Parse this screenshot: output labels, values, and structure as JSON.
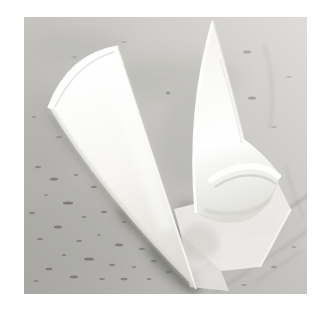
{
  "page": {
    "background": "#ffffff",
    "kind": "photograph-on-white-page"
  },
  "photo": {
    "type": "photograph",
    "alt": "Two white paper cones (rolled parchment piping cornets) on a gray marble surface: the left cone lies with its wide opening at the upper left and its tip pointing to the lower right; the right cone stands apex-up with its curled open end and a flat paper edge resting on the marble at the lower right. The marble is light gray with dark speckles at the lower left and diagonal veins at the lower right.",
    "objects": [
      {
        "name": "left-paper-cone",
        "description": "rolled white paper cone, wide opening upper-left, tapered tip lower-right"
      },
      {
        "name": "right-paper-cone",
        "description": "rolled white paper cone, apex at top, curled open mouth at bottom"
      },
      {
        "name": "paper-sheet",
        "description": "flat translucent paper edge lying on the counter beneath the right cone"
      },
      {
        "name": "marble-surface",
        "description": "light gray marble countertop with dark speckles and diagonal veining"
      },
      {
        "name": "cast-shadow",
        "description": "soft gray shadows beneath both cones"
      }
    ],
    "colors": {
      "page_bg": "#ffffff",
      "marble_dark": "#a7a6a2",
      "marble_mid": "#c4c3bf",
      "marble_light": "#deddd9",
      "mottle": "#9f9e9a",
      "speckle": "#5f5e5a",
      "vein": "#8a8984",
      "paper_bright": "#ffffff",
      "paper_white": "#f7f6f2",
      "paper_shade": "#dddcd6",
      "paper_deep": "#c8c7c1",
      "paper_flat": "#eeede9",
      "shadow": "#55544f"
    }
  }
}
